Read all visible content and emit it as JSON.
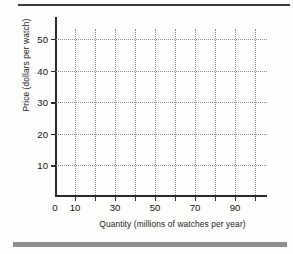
{
  "chart_data": {
    "type": "scatter",
    "title": "",
    "subtitle": "",
    "xlabel": "Quantity (millions of watches per year)",
    "ylabel": "Price (dollars per watch)",
    "xlim": [
      0,
      106
    ],
    "ylim": [
      0,
      57
    ],
    "grid": true,
    "legend": null,
    "annotations": [],
    "series": [],
    "x_ticks": [
      {
        "value": 0,
        "label": "0"
      },
      {
        "value": 10,
        "label": "10"
      },
      {
        "value": 20,
        "label": ""
      },
      {
        "value": 30,
        "label": "30"
      },
      {
        "value": 40,
        "label": ""
      },
      {
        "value": 50,
        "label": "50"
      },
      {
        "value": 60,
        "label": ""
      },
      {
        "value": 70,
        "label": "70"
      },
      {
        "value": 80,
        "label": ""
      },
      {
        "value": 90,
        "label": "90"
      },
      {
        "value": 100,
        "label": ""
      }
    ],
    "y_ticks": [
      {
        "value": 10,
        "label": "10"
      },
      {
        "value": 20,
        "label": "20"
      },
      {
        "value": 30,
        "label": "30"
      },
      {
        "value": 40,
        "label": "40"
      },
      {
        "value": 50,
        "label": "50"
      }
    ],
    "x_gridlines": [
      10,
      20,
      30,
      40,
      50,
      60,
      70,
      80,
      90,
      100
    ],
    "y_gridlines": [
      10,
      20,
      30,
      40,
      50
    ],
    "colors": {
      "background": "#fdfdfb",
      "axis": "#2b2b2b",
      "grid": "#8d8d8d",
      "text": "#121212",
      "rule_top": "#3a3a3a",
      "rule_bottom": "#8e8e8e"
    }
  }
}
